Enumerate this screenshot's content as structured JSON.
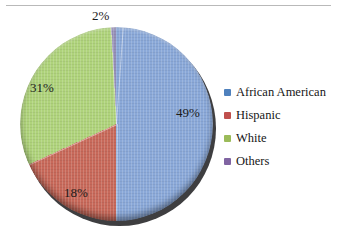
{
  "chart_data": {
    "type": "pie",
    "title": "",
    "categories": [
      "African American",
      "Hispanic",
      "White",
      "Others"
    ],
    "values": [
      49,
      18,
      31,
      2
    ],
    "value_unit": "%",
    "data_labels": [
      "49%",
      "18%",
      "31%",
      "2%"
    ],
    "colors": [
      "#8aa8d8",
      "#c8695a",
      "#afd37b",
      "#9690b8"
    ],
    "legend_position": "right",
    "grid": false,
    "start_angle_deg": 4,
    "direction": "clockwise"
  },
  "labels": {
    "african_american": "49%",
    "hispanic": "18%",
    "white": "31%",
    "others": "2%"
  },
  "legend": {
    "items": [
      {
        "label": "African American",
        "color": "#4f81bd"
      },
      {
        "label": "Hispanic",
        "color": "#c0504d"
      },
      {
        "label": "White",
        "color": "#9bbb59"
      },
      {
        "label": "Others",
        "color": "#8064a2"
      }
    ]
  },
  "style": {
    "background": "#ffffff",
    "rule_color": "#b9b9b9",
    "text_color": "#1b1b1b"
  }
}
